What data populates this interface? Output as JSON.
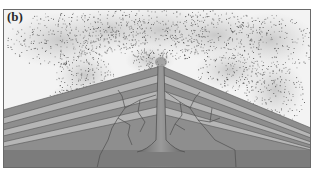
{
  "figure": {
    "panel_label": "(b)",
    "colors": {
      "background": "#ffffff",
      "frame": "#6a6a6a",
      "sky": "#f2f2f2",
      "ash_cloud": "#d6d6d6",
      "ash_particles": "#3a3a3a",
      "layer_dark": "#8e8e8e",
      "layer_light": "#b8b8b8",
      "ground": "#7c7c7c",
      "magma_glow": "#d8d8d8",
      "conduit": "#6e6e6e",
      "dike": "#555555"
    }
  }
}
